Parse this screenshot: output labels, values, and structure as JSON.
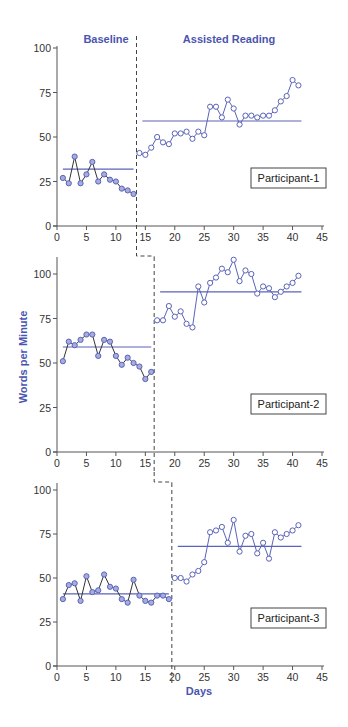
{
  "chart_data": {
    "type": "line",
    "layout": "multiple-baseline-across-participants (3 stacked panels)",
    "phase_labels": [
      "Baseline",
      "Assisted Reading"
    ],
    "xlabel": "Days",
    "ylabel": "Words per Minute",
    "x_ticks": [
      0,
      5,
      10,
      15,
      20,
      25,
      30,
      35,
      40,
      45
    ],
    "xlim": [
      0,
      45
    ],
    "colors": {
      "line": "#5a63b8",
      "baseline_marker_fill": "#a7acdf",
      "treatment_marker_fill": "#ffffff",
      "data_line": "#333333",
      "phase_text": "#4a55b0",
      "axis": "#555555"
    },
    "panels": [
      {
        "participant": "Participant-1",
        "y_ticks": [
          0,
          25,
          50,
          75,
          100
        ],
        "ylim": [
          0,
          100
        ],
        "phase_change_day": 13.5,
        "baseline": {
          "days": [
            1,
            2,
            3,
            4,
            5,
            6,
            7,
            8,
            9,
            10,
            11,
            12,
            13
          ],
          "values": [
            27,
            24,
            39,
            24,
            29,
            36,
            25,
            29,
            26,
            25,
            21,
            20,
            18
          ],
          "mean": 32
        },
        "treatment": {
          "days": [
            14,
            15,
            16,
            17,
            18,
            19,
            20,
            21,
            22,
            23,
            24,
            25,
            26,
            27,
            28,
            29,
            30,
            31,
            32,
            33,
            34,
            35,
            36,
            37,
            38,
            39,
            40,
            41
          ],
          "values": [
            41,
            40,
            44,
            50,
            47,
            46,
            52,
            52,
            53,
            49,
            53,
            51,
            67,
            67,
            61,
            71,
            66,
            57,
            62,
            62,
            61,
            62,
            62,
            65,
            70,
            73,
            82,
            79
          ],
          "mean": 59
        }
      },
      {
        "participant": "Participant-2",
        "y_ticks": [
          0,
          25,
          50,
          75,
          100
        ],
        "ylim": [
          0,
          100
        ],
        "phase_change_day": 16.5,
        "baseline": {
          "days": [
            1,
            2,
            3,
            4,
            5,
            6,
            7,
            8,
            9,
            10,
            11,
            12,
            13,
            14,
            15,
            16
          ],
          "values": [
            51,
            62,
            60,
            63,
            66,
            66,
            54,
            63,
            62,
            54,
            49,
            53,
            50,
            48,
            41,
            45
          ],
          "mean": 59
        },
        "treatment": {
          "days": [
            17,
            18,
            19,
            20,
            21,
            22,
            23,
            24,
            25,
            26,
            27,
            28,
            29,
            30,
            31,
            32,
            33,
            34,
            35,
            36,
            37,
            38,
            39,
            40,
            41
          ],
          "values": [
            74,
            74,
            82,
            76,
            79,
            72,
            70,
            93,
            84,
            95,
            98,
            103,
            101,
            108,
            96,
            102,
            100,
            89,
            93,
            92,
            87,
            90,
            93,
            95,
            99
          ],
          "mean": 90
        }
      },
      {
        "participant": "Participant-3",
        "y_ticks": [
          0,
          25,
          50,
          75,
          100
        ],
        "ylim": [
          0,
          100
        ],
        "phase_change_day": 19.5,
        "baseline": {
          "days": [
            1,
            2,
            3,
            4,
            5,
            6,
            7,
            8,
            9,
            10,
            11,
            12,
            13,
            14,
            15,
            16,
            17,
            18,
            19
          ],
          "values": [
            38,
            46,
            47,
            37,
            51,
            42,
            43,
            52,
            45,
            44,
            38,
            36,
            49,
            40,
            37,
            36,
            40,
            40,
            38
          ],
          "mean": 41
        },
        "treatment": {
          "days": [
            20,
            21,
            22,
            23,
            24,
            25,
            26,
            27,
            28,
            29,
            30,
            31,
            32,
            33,
            34,
            35,
            36,
            37,
            38,
            39,
            40,
            41
          ],
          "values": [
            50,
            50,
            48,
            52,
            54,
            59,
            76,
            77,
            79,
            70,
            83,
            65,
            74,
            75,
            64,
            70,
            61,
            76,
            73,
            75,
            77,
            80
          ],
          "mean": 68
        }
      }
    ]
  }
}
